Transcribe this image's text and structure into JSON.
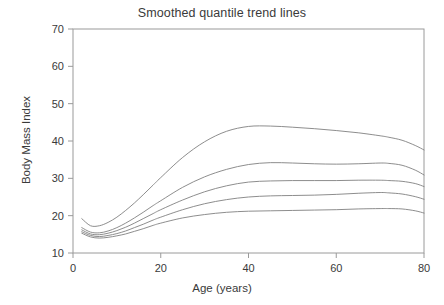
{
  "chart_data": {
    "type": "line",
    "title": "Smoothed quantile trend lines",
    "xlabel": "Age (years)",
    "ylabel": "Body Mass Index",
    "xlim": [
      0,
      80
    ],
    "ylim": [
      10,
      70
    ],
    "xticks": [
      0,
      20,
      40,
      60,
      80
    ],
    "yticks": [
      10,
      20,
      30,
      40,
      50,
      60,
      70
    ],
    "grid": false,
    "legend": "none",
    "line_color": "#808080",
    "background_color": "#ffffff",
    "axis_color": "#9a9a9a",
    "x": [
      2,
      4,
      6,
      8,
      10,
      12,
      14,
      16,
      18,
      20,
      25,
      30,
      35,
      40,
      45,
      50,
      55,
      60,
      65,
      70,
      72,
      75,
      78,
      80
    ],
    "series": [
      {
        "name": "upper quantile",
        "values": [
          19.2,
          17.3,
          17.3,
          18.2,
          19.6,
          21.4,
          23.4,
          25.6,
          27.9,
          30.2,
          35.6,
          39.8,
          42.6,
          43.9,
          44.0,
          43.7,
          43.3,
          42.8,
          42.2,
          41.4,
          41.0,
          40.2,
          38.8,
          37.6
        ]
      },
      {
        "name": "second quantile",
        "values": [
          16.8,
          15.6,
          15.4,
          15.9,
          16.8,
          18.0,
          19.4,
          20.9,
          22.5,
          24.0,
          27.6,
          30.4,
          32.4,
          33.7,
          34.2,
          34.1,
          33.9,
          33.8,
          33.9,
          34.1,
          34.0,
          33.5,
          32.2,
          30.9
        ]
      },
      {
        "name": "median",
        "values": [
          16.2,
          15.1,
          14.9,
          15.3,
          16.0,
          16.9,
          18.0,
          19.2,
          20.4,
          21.6,
          24.2,
          26.4,
          28.0,
          29.0,
          29.3,
          29.4,
          29.4,
          29.4,
          29.5,
          29.5,
          29.4,
          29.2,
          28.6,
          27.8
        ]
      },
      {
        "name": "fourth quantile",
        "values": [
          15.7,
          14.7,
          14.4,
          14.7,
          15.2,
          15.9,
          16.8,
          17.7,
          18.7,
          19.6,
          21.6,
          23.2,
          24.3,
          25.0,
          25.3,
          25.4,
          25.5,
          25.7,
          26.0,
          26.2,
          26.1,
          25.8,
          25.1,
          24.4
        ]
      },
      {
        "name": "lower quantile",
        "values": [
          15.3,
          14.3,
          14.0,
          14.2,
          14.6,
          15.1,
          15.8,
          16.5,
          17.3,
          18.0,
          19.4,
          20.3,
          20.9,
          21.2,
          21.3,
          21.4,
          21.5,
          21.6,
          21.8,
          21.9,
          21.9,
          21.8,
          21.3,
          20.7
        ]
      }
    ]
  }
}
